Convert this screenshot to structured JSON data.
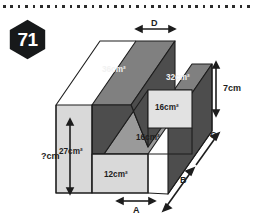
{
  "page": {
    "number_badge": "71",
    "badge_shape": "hexagon",
    "badge_color": "#17191a",
    "rule_style": "dotted"
  },
  "figure": {
    "name": "stepped-rectangular-solid",
    "projection": "oblique",
    "colors": {
      "front_face": "#d9d9d9",
      "top_face": "#808080",
      "side_face": "#4d4d4d",
      "outline": "#1d1d1d",
      "label_dark_text": "#1d1d1d",
      "label_light_text": "#f2f2f2"
    },
    "face_labels": [
      {
        "id": "top-left-face",
        "value": "36",
        "unit": "cm",
        "exp": "2",
        "text": "36cm²",
        "tone": "light"
      },
      {
        "id": "top-right-face",
        "value": "32",
        "unit": "cm",
        "exp": "2",
        "text": "32cm²",
        "tone": "light"
      },
      {
        "id": "step-riser-face",
        "value": "16",
        "unit": "cm",
        "exp": "2",
        "text": "16cm²",
        "tone": "dark"
      },
      {
        "id": "step-tread-face",
        "value": "16",
        "unit": "cm",
        "exp": "2",
        "text": "16cm²",
        "tone": "dark"
      },
      {
        "id": "front-tall-face",
        "value": "27",
        "unit": "cm",
        "exp": "2",
        "text": "27cm²",
        "tone": "dark"
      },
      {
        "id": "front-short-face",
        "value": "12",
        "unit": "cm",
        "exp": "2",
        "text": "12cm²",
        "tone": "dark"
      }
    ],
    "dimension_labels": [
      {
        "id": "dim-d",
        "text": "D",
        "position": "top",
        "arrow": "double-horizontal"
      },
      {
        "id": "dim-7cm",
        "text": "7cm",
        "position": "right-vertical",
        "arrow": "double-vertical"
      },
      {
        "id": "dim-c",
        "text": "C",
        "position": "right-depth",
        "arrow": "single-diagonal"
      },
      {
        "id": "dim-b",
        "text": "B",
        "position": "lower-depth",
        "arrow": "single-diagonal"
      },
      {
        "id": "dim-unknown",
        "text": "?cm",
        "position": "left-vertical",
        "arrow": "double-vertical"
      },
      {
        "id": "dim-a",
        "text": "A",
        "position": "bottom",
        "arrow": "double-horizontal"
      }
    ]
  }
}
